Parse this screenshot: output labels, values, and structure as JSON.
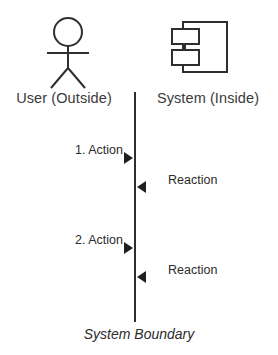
{
  "diagram": {
    "title": "System Boundary",
    "stroke_color": "#2e2e2e",
    "text_color": "#2b2b2b",
    "label_color": "#3a3a3a",
    "background_color": "#ffffff",
    "columns": [
      {
        "id": "actor",
        "label": "User (Outside)",
        "icon": "stick-figure-actor-icon"
      },
      {
        "id": "system",
        "label": "System (Inside)",
        "icon": "uml-component-icon"
      }
    ],
    "boundary": {
      "caption": "System Boundary",
      "orientation": "vertical"
    },
    "messages": [
      {
        "id": "action-1",
        "label": "1. Action",
        "direction": "right",
        "arrow": "solid-triangle-right"
      },
      {
        "id": "reaction-1",
        "label": "Reaction",
        "direction": "left",
        "arrow": "solid-triangle-left"
      },
      {
        "id": "action-2",
        "label": "2. Action",
        "direction": "right",
        "arrow": "solid-triangle-right"
      },
      {
        "id": "reaction-2",
        "label": "Reaction",
        "direction": "left",
        "arrow": "solid-triangle-left"
      }
    ]
  }
}
